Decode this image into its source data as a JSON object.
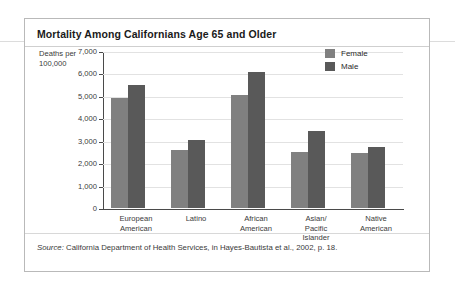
{
  "figure": {
    "title": "Mortality Among Californians Age 65 and Older",
    "source_prefix": "Source:",
    "source_text": " California Department of Health Services, in Hayes-Bautista et al., 2002, p. 18."
  },
  "colors": {
    "female": "#808080",
    "male": "#595959",
    "axis": "#4a4a4a",
    "gridline": "#e2e2e2",
    "frame": "#b9b9b9"
  },
  "chart_data": {
    "type": "bar",
    "title": "Mortality Among Californians Age 65 and Older",
    "xlabel": "",
    "ylabel": "Deaths per 100,000",
    "ylim": [
      0,
      7000
    ],
    "yticks": [
      0,
      1000,
      2000,
      3000,
      4000,
      5000,
      6000,
      7000
    ],
    "ytick_labels": [
      "0",
      "1,000",
      "2,000",
      "3,000",
      "4,000",
      "5,000",
      "6,000",
      "7,000"
    ],
    "grid": true,
    "legend_position": "top-right",
    "categories": [
      "European American",
      "Latino",
      "African American",
      "Asian/ Pacific Islander",
      "Native American"
    ],
    "category_lines": [
      [
        "European",
        "American"
      ],
      [
        "Latino"
      ],
      [
        "African",
        "American"
      ],
      [
        "Asian/",
        "Pacific",
        "Islander"
      ],
      [
        "Native",
        "American"
      ]
    ],
    "series": [
      {
        "name": "Female",
        "color": "#808080",
        "values": [
          4900,
          2600,
          5050,
          2500,
          2450
        ]
      },
      {
        "name": "Male",
        "color": "#595959",
        "values": [
          5500,
          3050,
          6050,
          3450,
          2700
        ]
      }
    ]
  }
}
